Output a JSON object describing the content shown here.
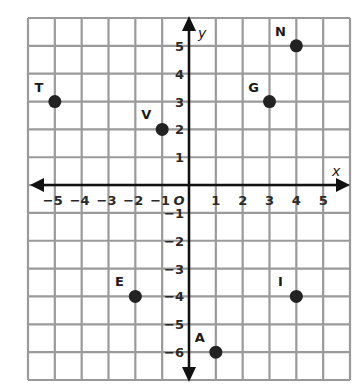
{
  "chart_data": {
    "type": "scatter",
    "title": "",
    "xlabel": "x",
    "ylabel": "y",
    "xlim": [
      -6,
      6
    ],
    "ylim": [
      -7,
      6
    ],
    "grid": true,
    "x_ticks": [
      "-5",
      "-4",
      "-3",
      "-2",
      "-1",
      "0",
      "1",
      "2",
      "3",
      "4",
      "5"
    ],
    "y_ticks": [
      "5",
      "4",
      "3",
      "2",
      "1",
      "-1",
      "-2",
      "-3",
      "-4",
      "-5",
      "-6"
    ],
    "origin_label": "O",
    "points": [
      {
        "label": "T",
        "x": -5,
        "y": 3
      },
      {
        "label": "V",
        "x": -1,
        "y": 2
      },
      {
        "label": "G",
        "x": 3,
        "y": 3
      },
      {
        "label": "N",
        "x": 4,
        "y": 5
      },
      {
        "label": "E",
        "x": -2,
        "y": -4
      },
      {
        "label": "I",
        "x": 4,
        "y": -4
      },
      {
        "label": "A",
        "x": 1,
        "y": -6
      }
    ],
    "colors": {
      "grid": "#9a9a9a",
      "axis": "#111111",
      "point": "#222222"
    }
  }
}
